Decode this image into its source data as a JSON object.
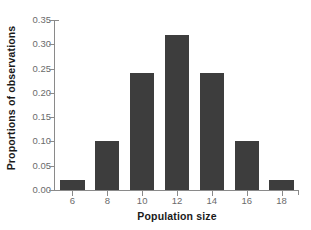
{
  "chart_data": {
    "type": "bar",
    "title": "",
    "subtitle": "",
    "xlabel": "Population size",
    "ylabel": "Proportions of observations",
    "categories": [
      "6",
      "8",
      "10",
      "12",
      "14",
      "16",
      "18"
    ],
    "values": [
      0.02,
      0.1,
      0.24,
      0.32,
      0.24,
      0.1,
      0.02
    ],
    "series": [
      {
        "name": "Proportions of observations",
        "values": [
          0.02,
          0.1,
          0.24,
          0.32,
          0.24,
          0.1,
          0.02
        ]
      }
    ],
    "ylim": [
      0.0,
      0.35
    ],
    "ytick_labels": [
      "0.00",
      "0.05",
      "0.10",
      "0.15",
      "0.20",
      "0.25",
      "0.30",
      "0.35"
    ],
    "ytick_values": [
      0.0,
      0.05,
      0.1,
      0.15,
      0.2,
      0.25,
      0.3,
      0.35
    ],
    "xtick_labels": [
      "6",
      "8",
      "10",
      "12",
      "14",
      "16",
      "18"
    ],
    "grid": false,
    "legend": false,
    "legend_position": "none",
    "bar_color": "#3d3d3d",
    "axis_color": "#8a8a8a",
    "tick_label_color": "#6b6b6b",
    "axis_title_color": "#1a1a1a",
    "background_color": "#ffffff",
    "annotations": []
  }
}
